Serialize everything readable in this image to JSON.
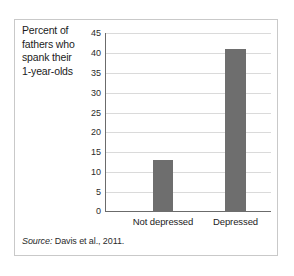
{
  "figure": {
    "title_lines": [
      "Percent of",
      "fathers who",
      "spank their",
      "1-year-olds"
    ],
    "source_prefix": "Source:",
    "source_text": " Davis et al., 2011."
  },
  "colors": {
    "bar_fill": "#6e6e6e",
    "grid": "#dadada",
    "axis": "#6b6b6b",
    "frame": "#c9c9c9",
    "text": "#1b1b1b"
  },
  "chart_data": {
    "type": "bar",
    "title": "Percent of fathers who spank their 1-year-olds",
    "xlabel": "",
    "ylabel": "",
    "categories": [
      "Not depressed",
      "Depressed"
    ],
    "values": [
      13,
      41
    ],
    "ylim": [
      0,
      45
    ],
    "yticks": [
      0,
      5,
      10,
      15,
      20,
      25,
      30,
      35,
      40,
      45
    ],
    "ytick_labels": [
      "0",
      "5",
      "10",
      "15",
      "20",
      "25",
      "30",
      "35",
      "40",
      "45"
    ],
    "grid": true,
    "legend": null,
    "source": "Source: Davis et al., 2011."
  }
}
